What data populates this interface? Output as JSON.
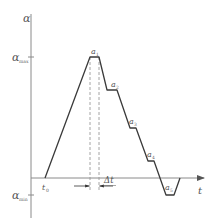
{
  "diagram": {
    "type": "angle-time profile",
    "axes": {
      "y_label": "α",
      "x_label": "t",
      "y_ticks": [
        {
          "label": "α",
          "sub": "max"
        },
        {
          "label": "α",
          "sub": "min"
        }
      ]
    },
    "points": [
      {
        "label": "t",
        "sub": "0"
      },
      {
        "label": "a",
        "sub": "1"
      },
      {
        "label": "a",
        "sub": "2"
      },
      {
        "label": "a",
        "sub": "3"
      },
      {
        "label": "a",
        "sub": "4"
      },
      {
        "label": "a",
        "sub": "5"
      }
    ],
    "interval": {
      "label": "Δt"
    },
    "colors": {
      "axis": "#8a8a8a",
      "curve": "#3a3a3a",
      "dashed": "#9a9a9a",
      "text": "#555555"
    }
  }
}
